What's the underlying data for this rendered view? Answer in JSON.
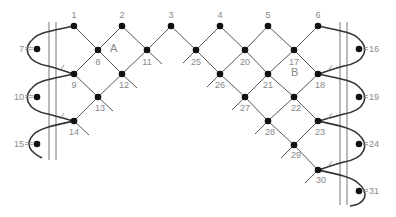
{
  "diagram": {
    "colors": {
      "line": "#555555",
      "rope": "#333333",
      "node": "#111111",
      "label": "#888888",
      "rail": "#777777"
    },
    "regions": [
      {
        "label": "A",
        "x": 110,
        "y": 52
      },
      {
        "label": "B",
        "x": 291,
        "y": 76
      }
    ],
    "nodes": [
      {
        "id": "1",
        "x": 74,
        "y": 26,
        "lx": 74,
        "ly": 18,
        "anchor": "middle"
      },
      {
        "id": "2",
        "x": 122,
        "y": 26,
        "lx": 122,
        "ly": 18,
        "anchor": "middle"
      },
      {
        "id": "3",
        "x": 171,
        "y": 26,
        "lx": 171,
        "ly": 18,
        "anchor": "middle"
      },
      {
        "id": "4",
        "x": 220,
        "y": 26,
        "lx": 220,
        "ly": 18,
        "anchor": "middle"
      },
      {
        "id": "5",
        "x": 268,
        "y": 26,
        "lx": 268,
        "ly": 18,
        "anchor": "middle"
      },
      {
        "id": "6",
        "x": 318,
        "y": 26,
        "lx": 318,
        "ly": 18,
        "anchor": "middle"
      },
      {
        "id": "7",
        "x": 37,
        "y": 49,
        "lx": 24,
        "ly": 52,
        "anchor": "end"
      },
      {
        "id": "8",
        "x": 98,
        "y": 50,
        "lx": 98,
        "ly": 65,
        "anchor": "middle"
      },
      {
        "id": "11",
        "x": 147,
        "y": 50,
        "lx": 147,
        "ly": 65,
        "anchor": "middle"
      },
      {
        "id": "25",
        "x": 196,
        "y": 50,
        "lx": 196,
        "ly": 65,
        "anchor": "middle"
      },
      {
        "id": "20",
        "x": 245,
        "y": 50,
        "lx": 245,
        "ly": 65,
        "anchor": "middle"
      },
      {
        "id": "17",
        "x": 294,
        "y": 50,
        "lx": 294,
        "ly": 65,
        "anchor": "middle"
      },
      {
        "id": "16",
        "x": 359,
        "y": 49,
        "lx": 369,
        "ly": 52,
        "anchor": "start"
      },
      {
        "id": "9",
        "x": 74,
        "y": 74,
        "lx": 74,
        "ly": 88,
        "anchor": "middle"
      },
      {
        "id": "12",
        "x": 122,
        "y": 74,
        "lx": 124,
        "ly": 88,
        "anchor": "middle"
      },
      {
        "id": "26",
        "x": 220,
        "y": 74,
        "lx": 220,
        "ly": 88,
        "anchor": "middle"
      },
      {
        "id": "21",
        "x": 268,
        "y": 74,
        "lx": 268,
        "ly": 88,
        "anchor": "middle"
      },
      {
        "id": "18",
        "x": 318,
        "y": 74,
        "lx": 320,
        "ly": 88,
        "anchor": "middle"
      },
      {
        "id": "10",
        "x": 37,
        "y": 97,
        "lx": 24,
        "ly": 100,
        "anchor": "end"
      },
      {
        "id": "13",
        "x": 98,
        "y": 97,
        "lx": 100,
        "ly": 111,
        "anchor": "middle"
      },
      {
        "id": "27",
        "x": 245,
        "y": 97,
        "lx": 245,
        "ly": 111,
        "anchor": "middle"
      },
      {
        "id": "22",
        "x": 294,
        "y": 97,
        "lx": 296,
        "ly": 111,
        "anchor": "middle"
      },
      {
        "id": "19",
        "x": 359,
        "y": 97,
        "lx": 369,
        "ly": 100,
        "anchor": "start"
      },
      {
        "id": "14",
        "x": 74,
        "y": 121,
        "lx": 74,
        "ly": 135,
        "anchor": "middle"
      },
      {
        "id": "28",
        "x": 268,
        "y": 121,
        "lx": 270,
        "ly": 135,
        "anchor": "middle"
      },
      {
        "id": "23",
        "x": 318,
        "y": 121,
        "lx": 320,
        "ly": 135,
        "anchor": "middle"
      },
      {
        "id": "15",
        "x": 37,
        "y": 144,
        "lx": 24,
        "ly": 147,
        "anchor": "end"
      },
      {
        "id": "29",
        "x": 294,
        "y": 145,
        "lx": 296,
        "ly": 158,
        "anchor": "middle"
      },
      {
        "id": "24",
        "x": 359,
        "y": 144,
        "lx": 369,
        "ly": 147,
        "anchor": "start"
      },
      {
        "id": "30",
        "x": 318,
        "y": 170,
        "lx": 321,
        "ly": 183,
        "anchor": "middle"
      },
      {
        "id": "31",
        "x": 359,
        "y": 191,
        "lx": 369,
        "ly": 194,
        "anchor": "start"
      }
    ],
    "edges": [
      [
        "1",
        "8"
      ],
      [
        "8",
        "2"
      ],
      [
        "2",
        "11"
      ],
      [
        "11",
        "3"
      ],
      [
        "3",
        "25"
      ],
      [
        "25",
        "4"
      ],
      [
        "4",
        "20"
      ],
      [
        "20",
        "5"
      ],
      [
        "5",
        "17"
      ],
      [
        "17",
        "6"
      ],
      [
        "8",
        "9"
      ],
      [
        "8",
        "12"
      ],
      [
        "11",
        "12"
      ],
      [
        "25",
        "26"
      ],
      [
        "20",
        "26"
      ],
      [
        "20",
        "21"
      ],
      [
        "17",
        "21"
      ],
      [
        "17",
        "18"
      ],
      [
        "9",
        "13"
      ],
      [
        "12",
        "13"
      ],
      [
        "26",
        "27"
      ],
      [
        "21",
        "27"
      ],
      [
        "21",
        "22"
      ],
      [
        "18",
        "22"
      ],
      [
        "13",
        "14"
      ],
      [
        "27",
        "28"
      ],
      [
        "22",
        "28"
      ],
      [
        "22",
        "23"
      ],
      [
        "28",
        "29"
      ],
      [
        "23",
        "29"
      ],
      [
        "29",
        "30"
      ]
    ],
    "stubs": [
      {
        "x1": 147,
        "y1": 50,
        "x2": 162,
        "y2": 64
      },
      {
        "x1": 196,
        "y1": 50,
        "x2": 183,
        "y2": 63
      },
      {
        "x1": 122,
        "y1": 74,
        "x2": 137,
        "y2": 88
      },
      {
        "x1": 220,
        "y1": 74,
        "x2": 207,
        "y2": 87
      },
      {
        "x1": 98,
        "y1": 97,
        "x2": 113,
        "y2": 111
      },
      {
        "x1": 245,
        "y1": 97,
        "x2": 232,
        "y2": 110
      },
      {
        "x1": 74,
        "y1": 121,
        "x2": 89,
        "y2": 135
      },
      {
        "x1": 268,
        "y1": 121,
        "x2": 255,
        "y2": 134
      },
      {
        "x1": 294,
        "y1": 145,
        "x2": 281,
        "y2": 158
      },
      {
        "x1": 318,
        "y1": 170,
        "x2": 305,
        "y2": 183
      }
    ],
    "rails": {
      "left": [
        49,
        56
      ],
      "right": [
        340,
        347
      ],
      "left_y": [
        22,
        160
      ],
      "right_y": [
        22,
        205
      ]
    },
    "ropes": [
      "M74,26 C55,30 40,32 34,38 C22,48 26,62 48,66 C60,69 66,72 74,74",
      "M74,74 C55,78 40,80 34,86 C22,96 26,110 48,114 C60,117 66,119 74,121",
      "M74,121 C55,125 40,128 34,134 C24,144 30,152 42,158",
      "M318,26 C337,30 352,32 358,38 C370,48 366,62 344,66 C332,69 326,72 318,74",
      "M318,74 C337,78 352,80 358,86 C370,96 366,110 344,114 C332,117 326,119 318,121",
      "M318,121 C337,125 352,128 358,134 C370,144 366,158 344,162 C332,165 326,168 318,170",
      "M318,170 C337,174 352,177 358,183 C370,193 366,204 350,206"
    ],
    "ticks": [
      {
        "x": 62,
        "y": 68
      },
      {
        "x": 62,
        "y": 116
      },
      {
        "x": 330,
        "y": 68
      },
      {
        "x": 330,
        "y": 116
      },
      {
        "x": 330,
        "y": 164
      }
    ]
  }
}
